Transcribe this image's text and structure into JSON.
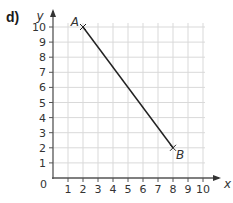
{
  "part_label": "d)",
  "chart_data": {
    "type": "line",
    "title": "",
    "xlabel": "x",
    "ylabel": "y",
    "xlim": [
      0,
      10
    ],
    "ylim": [
      0,
      10
    ],
    "grid": true,
    "x_ticks": [
      "1",
      "2",
      "3",
      "4",
      "5",
      "6",
      "7",
      "8",
      "9",
      "10"
    ],
    "y_ticks": [
      "1",
      "2",
      "3",
      "4",
      "5",
      "6",
      "7",
      "8",
      "9",
      "10"
    ],
    "origin_label": "0",
    "series": [
      {
        "name": "AB",
        "points": [
          {
            "label": "A",
            "x": 2,
            "y": 10
          },
          {
            "label": "B",
            "x": 8,
            "y": 2
          }
        ]
      }
    ]
  }
}
